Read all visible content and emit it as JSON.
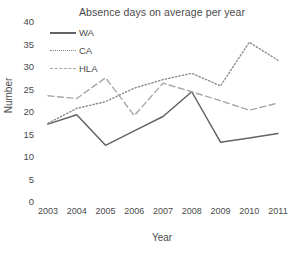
{
  "chart_data": {
    "type": "line",
    "title": "Absence days on average per year",
    "xlabel": "Year",
    "ylabel": "Number",
    "categories": [
      "2003",
      "2004",
      "2005",
      "2006",
      "2007",
      "2008",
      "2009",
      "2010",
      "2011"
    ],
    "x": [
      2003,
      2004,
      2005,
      2006,
      2007,
      2008,
      2009,
      2010,
      2011
    ],
    "xlim": [
      2003,
      2011
    ],
    "ylim": [
      0,
      40
    ],
    "yticks": [
      0,
      5,
      10,
      15,
      20,
      25,
      30,
      35,
      40
    ],
    "grid": false,
    "legend_position": "upper-left-inside",
    "series": [
      {
        "name": "WA",
        "style": "solid",
        "color": "#636363",
        "values": [
          17.3,
          19.4,
          12.6,
          15.8,
          19.0,
          24.5,
          13.3,
          14.2,
          15.2
        ]
      },
      {
        "name": "CA",
        "style": "dotted",
        "color": "#8a8a8a",
        "values": [
          17.5,
          20.8,
          22.3,
          25.3,
          27.2,
          28.6,
          25.8,
          35.5,
          31.5
        ]
      },
      {
        "name": "HLA",
        "style": "dashed",
        "color": "#a8a8a8",
        "values": [
          23.6,
          23.0,
          27.6,
          19.2,
          26.4,
          24.5,
          22.5,
          20.4,
          22.0
        ]
      }
    ]
  }
}
